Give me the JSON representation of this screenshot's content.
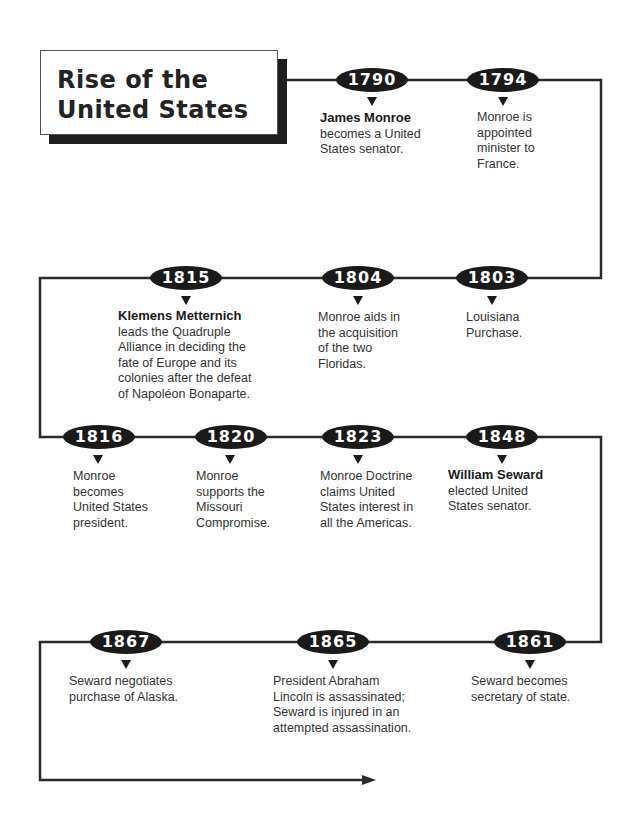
{
  "title": {
    "line1": "Rise of the",
    "line2": "United States"
  },
  "colors": {
    "line": "#2a2a2a",
    "pill": "#1a1a1a",
    "text": "#333333"
  },
  "events": [
    {
      "year": "1790",
      "bold": "James Monroe",
      "text": "becomes a United States senator."
    },
    {
      "year": "1794",
      "bold": "",
      "text": "Monroe is appointed minister to France."
    },
    {
      "year": "1803",
      "bold": "",
      "text": "Louisiana Purchase."
    },
    {
      "year": "1804",
      "bold": "",
      "text": "Monroe aids in the acquisition of the two Floridas."
    },
    {
      "year": "1815",
      "bold": "Klemens Metternich",
      "text": "leads the Quadruple Alliance in deciding the fate of Europe and its colonies after the defeat of Napoléon Bonaparte."
    },
    {
      "year": "1816",
      "bold": "",
      "text": "Monroe becomes United States president."
    },
    {
      "year": "1820",
      "bold": "",
      "text": "Monroe supports the Missouri Compromise."
    },
    {
      "year": "1823",
      "bold": "",
      "text": "Monroe Doctrine claims United States interest in all the Americas."
    },
    {
      "year": "1848",
      "bold": "William Seward",
      "text": "elected United States senator."
    },
    {
      "year": "1861",
      "bold": "",
      "text": "Seward becomes secretary of state."
    },
    {
      "year": "1865",
      "bold": "",
      "text": "President Abraham Lincoln is assassinated; Seward is injured in an attempted assassination."
    },
    {
      "year": "1867",
      "bold": "",
      "text": "Seward negotiates purchase of Alaska."
    }
  ]
}
